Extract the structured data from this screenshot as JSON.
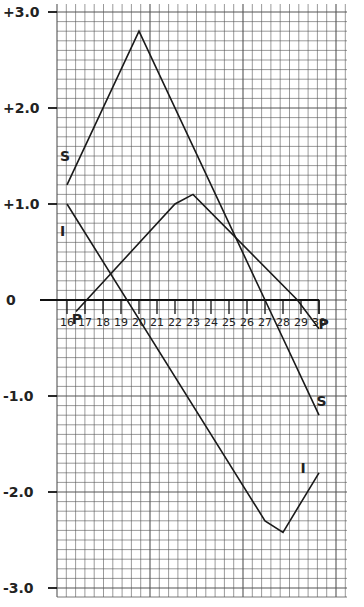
{
  "chart_data": {
    "type": "line",
    "title": "",
    "xlabel": "",
    "ylabel": "",
    "x": [
      16,
      17,
      18,
      19,
      20,
      21,
      22,
      23,
      24,
      25,
      26,
      27,
      28,
      29,
      30
    ],
    "x_tick_labels": [
      "16",
      "17",
      "18",
      "19",
      "20",
      "21",
      "22",
      "23",
      "24",
      "25",
      "26",
      "27",
      "28",
      "29",
      "30"
    ],
    "y_tick_labels": [
      "+3.0",
      "+2.0",
      "+1.0",
      "0",
      "-1.0",
      "-2.0",
      "-3.0"
    ],
    "y_ticks": [
      3.0,
      2.0,
      1.0,
      0,
      -1.0,
      -2.0,
      -3.0
    ],
    "ylim": [
      -3.1,
      3.1
    ],
    "xlim": [
      15.5,
      31.5
    ],
    "grid": true,
    "legend": "inline labels",
    "series": [
      {
        "name": "S",
        "points": [
          [
            16,
            1.2
          ],
          [
            20,
            2.8
          ],
          [
            27,
            0.0
          ],
          [
            30,
            -1.2
          ]
        ]
      },
      {
        "name": "I",
        "points": [
          [
            16,
            1.0
          ],
          [
            27,
            -2.3
          ],
          [
            28,
            -2.42
          ],
          [
            30,
            -1.8
          ]
        ]
      },
      {
        "name": "P",
        "points": [
          [
            16.5,
            -0.12
          ],
          [
            22,
            1.0
          ],
          [
            23,
            1.1
          ],
          [
            28.8,
            0.0
          ],
          [
            30,
            -0.3
          ]
        ]
      }
    ],
    "series_labels": [
      {
        "text": "S",
        "x": 15.95,
        "y": 1.5
      },
      {
        "text": "S",
        "x": 30.2,
        "y": -1.05
      },
      {
        "text": "I",
        "x": 15.95,
        "y": 0.72
      },
      {
        "text": "I",
        "x": 29.3,
        "y": -1.75
      },
      {
        "text": "P",
        "x": 16.6,
        "y": -0.2
      },
      {
        "text": "P",
        "x": 30.3,
        "y": -0.25
      }
    ]
  }
}
